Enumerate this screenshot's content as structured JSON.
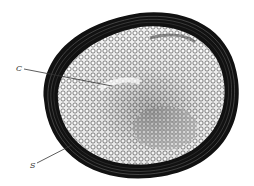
{
  "figure": {
    "type": "cross-section illustration",
    "labels": [
      {
        "id": "C",
        "text": "C",
        "x": 17,
        "y": 66,
        "line_to": [
          112,
          86
        ]
      },
      {
        "id": "S",
        "text": "S",
        "x": 31,
        "y": 163,
        "line_to": [
          72,
          145
        ]
      }
    ],
    "colors": {
      "background": "#ffffff",
      "outer_layer": "#1a1a1a",
      "inner_tissue": "#d9d9d9",
      "cell_walls": "#3a3a3a",
      "label_text": "#333333"
    }
  }
}
